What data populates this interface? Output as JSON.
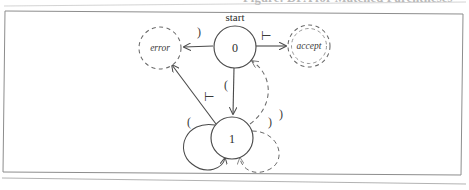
{
  "page": {
    "caption": "Figure: DFA for Matched Parentheses",
    "border_color": "#8d8d8d",
    "ink_color": "#4a4a4a",
    "paper_color": "#ffffff"
  },
  "diagram": {
    "type": "state-machine",
    "start_label": "start",
    "states": [
      {
        "id": "error",
        "label": "error",
        "shape": "dashed-circle",
        "italic": true,
        "cx": 160,
        "cy": 48,
        "r": 21
      },
      {
        "id": "0",
        "label": "0",
        "shape": "solid-circle",
        "italic": false,
        "cx": 235,
        "cy": 47,
        "r": 21
      },
      {
        "id": "accept",
        "label": "accept",
        "shape": "dashed-circle",
        "italic": true,
        "cx": 309,
        "cy": 46,
        "r": 21
      },
      {
        "id": "1",
        "label": "1",
        "shape": "solid-circle",
        "italic": false,
        "cx": 232,
        "cy": 138,
        "r": 21
      }
    ],
    "transitions": [
      {
        "from": "0",
        "to": "error",
        "label": ")",
        "style": "solid",
        "label_x": 199,
        "label_y": 36
      },
      {
        "from": "0",
        "to": "accept",
        "label": "⊢",
        "style": "solid",
        "label_x": 266,
        "label_y": 40
      },
      {
        "from": "0",
        "to": "1",
        "label": "(",
        "style": "solid",
        "label_x": 226,
        "label_y": 85
      },
      {
        "from": "1",
        "to": "error",
        "label": "⊢",
        "style": "solid",
        "label_x": 209,
        "label_y": 101
      },
      {
        "from": "1",
        "to": "0",
        "label": ")",
        "style": "dashed",
        "label_x": 270,
        "label_y": 122
      },
      {
        "from": "1",
        "to": "1",
        "label": "(",
        "style": "solid",
        "label_x": 189,
        "label_y": 122
      },
      {
        "from": "1",
        "to": "1",
        "label": ")",
        "style": "dashed",
        "label_x": 278,
        "label_y": 117
      }
    ],
    "alphabet": [
      "(",
      ")",
      "⊢"
    ],
    "start_state": "0",
    "accepting_states": [
      "accept"
    ],
    "error_states": [
      "error"
    ]
  }
}
